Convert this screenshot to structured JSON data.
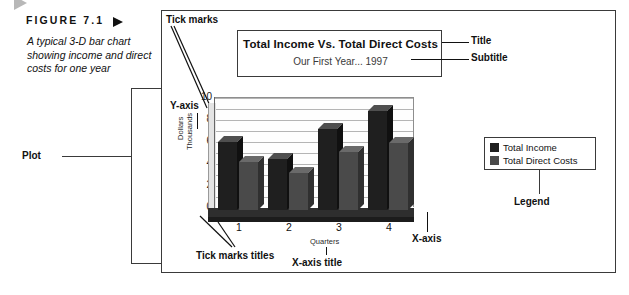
{
  "figure": {
    "label": "FIGURE 7.1",
    "caption": "A typical 3-D bar chart showing income and direct costs for one year",
    "arrow_icon": "triangle-right-icon"
  },
  "callouts": {
    "tick_marks": "Tick marks",
    "title": "Title",
    "subtitle": "Subtitle",
    "plot": "Plot",
    "y_axis": "Y-axis",
    "x_axis": "X-axis",
    "legend": "Legend",
    "tick_marks_titles": "Tick marks titles",
    "x_axis_title": "X-axis title"
  },
  "chart_data": {
    "type": "bar",
    "title": "Total Income Vs. Total Direct Costs",
    "subtitle": "Our First Year... 1997",
    "categories": [
      "1",
      "2",
      "3",
      "4"
    ],
    "series": [
      {
        "name": "Total Income",
        "values": [
          6.2,
          4.6,
          7.4,
          9.0
        ],
        "color": "#1f1f1f"
      },
      {
        "name": "Total Direct Costs",
        "values": [
          4.4,
          3.4,
          5.3,
          6.1
        ],
        "color": "#4a4a4a"
      }
    ],
    "xlabel": "Quarters",
    "ylabel": "Dollars Thousands",
    "ylabel_line1": "Dollars",
    "ylabel_line2": "Thousands",
    "yticks": [
      "10",
      "8",
      "6",
      "4",
      "2",
      "0"
    ],
    "ylim": [
      0,
      10
    ],
    "grid": true,
    "legend_position": "right",
    "legend_entries": [
      "Total Income",
      "Total Direct Costs"
    ]
  }
}
